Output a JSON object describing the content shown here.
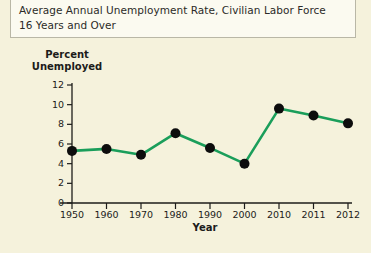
{
  "title": {
    "line1": "Average Annual Unemployment Rate, Civilian Labor Force",
    "line2": "16 Years and Over"
  },
  "chart_data": {
    "type": "line",
    "title": "Average Annual Unemployment Rate, Civilian Labor Force 16 Years and Over",
    "xlabel": "Year",
    "ylabel": "Percent Unemployed",
    "ylabel_line1": "Percent",
    "ylabel_line2": "Unemployed",
    "categories": [
      "1950",
      "1960",
      "1970",
      "1980",
      "1990",
      "2000",
      "2010",
      "2011",
      "2012"
    ],
    "values": [
      5.3,
      5.5,
      4.9,
      7.1,
      5.6,
      4.0,
      9.6,
      8.9,
      8.1
    ],
    "ylim": [
      0,
      12
    ],
    "yticks": [
      "12",
      "10",
      "8",
      "6",
      "4",
      "2",
      "0"
    ],
    "ytick_values": [
      12,
      10,
      8,
      6,
      4,
      2,
      0
    ],
    "xticks": [
      "1950",
      "1960",
      "1970",
      "1980",
      "1990",
      "2000",
      "2010",
      "2011",
      "2012"
    ],
    "grid": false,
    "legend": "none",
    "line_color": "#1a9e5a",
    "marker_color": "#0d0d0d",
    "axis_color": "#1c1c1a",
    "background_color": "#f5f2dc"
  }
}
